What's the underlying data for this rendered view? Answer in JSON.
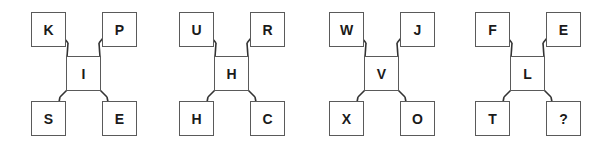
{
  "puzzle": {
    "groups": [
      {
        "top_left": "K",
        "top_right": "P",
        "center": "I",
        "bottom_left": "S",
        "bottom_right": "E"
      },
      {
        "top_left": "U",
        "top_right": "R",
        "center": "H",
        "bottom_left": "H",
        "bottom_right": "C"
      },
      {
        "top_left": "W",
        "top_right": "J",
        "center": "V",
        "bottom_left": "X",
        "bottom_right": "O"
      },
      {
        "top_left": "F",
        "top_right": "E",
        "center": "L",
        "bottom_left": "T",
        "bottom_right": "?"
      }
    ]
  },
  "colors": {
    "border": "#5a5a5a",
    "text": "#1a1a1a",
    "background": "#ffffff"
  }
}
